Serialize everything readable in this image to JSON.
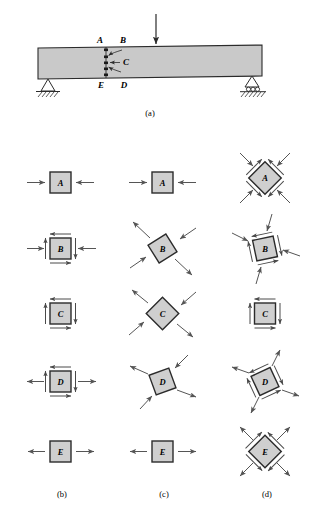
{
  "figure": {
    "colors": {
      "beam_fill": "#c9c9c9",
      "element_fill": "#cfcfcf",
      "outline": "#2b2b2b",
      "arrow": "#555555",
      "hatch": "#333333",
      "background": "#ffffff"
    }
  },
  "panel_a": {
    "caption": "(a)",
    "load_label": "",
    "points": [
      {
        "id": "A",
        "label": "A",
        "position": "top fiber"
      },
      {
        "id": "B",
        "label": "B",
        "position": "upper web"
      },
      {
        "id": "C",
        "label": "C",
        "position": "neutral axis"
      },
      {
        "id": "D",
        "label": "D",
        "position": "lower web"
      },
      {
        "id": "E",
        "label": "E",
        "position": "bottom fiber"
      }
    ],
    "supports": {
      "left": "pin-support",
      "right": "roller-support"
    }
  },
  "columns": [
    {
      "id": "b",
      "caption": "(b)",
      "description": "original x-y stress elements"
    },
    {
      "id": "c",
      "caption": "(c)",
      "description": "principal stress elements"
    },
    {
      "id": "d",
      "caption": "(d)",
      "description": "maximum shear stress elements"
    }
  ],
  "elements": {
    "b": [
      {
        "label": "A",
        "rotation": 0,
        "normals": "compression",
        "shear": false
      },
      {
        "label": "B",
        "rotation": 0,
        "normals": "compression",
        "shear": true
      },
      {
        "label": "C",
        "rotation": 0,
        "normals": "none",
        "shear": true
      },
      {
        "label": "D",
        "rotation": 0,
        "normals": "tension",
        "shear": true
      },
      {
        "label": "E",
        "rotation": 0,
        "normals": "tension",
        "shear": false
      }
    ],
    "c": [
      {
        "label": "A",
        "rotation": 0,
        "normals": "compression",
        "shear": false
      },
      {
        "label": "B",
        "rotation": 30,
        "normals": "biaxial",
        "shear": false
      },
      {
        "label": "C",
        "rotation": 45,
        "normals": "biaxial",
        "shear": false
      },
      {
        "label": "D",
        "rotation": 20,
        "normals": "biaxial",
        "shear": false
      },
      {
        "label": "E",
        "rotation": 0,
        "normals": "tension",
        "shear": false
      }
    ],
    "d": [
      {
        "label": "A",
        "rotation": 45,
        "normals": "compression",
        "shear": true
      },
      {
        "label": "B",
        "rotation": 12,
        "normals": "compression",
        "shear": true
      },
      {
        "label": "C",
        "rotation": 0,
        "normals": "none",
        "shear": true
      },
      {
        "label": "D",
        "rotation": 25,
        "normals": "tension",
        "shear": true
      },
      {
        "label": "E",
        "rotation": 45,
        "normals": "tension",
        "shear": true
      }
    ]
  },
  "row_labels": [
    "A",
    "B",
    "C",
    "D",
    "E"
  ],
  "captions": {
    "a": "(a)",
    "b": "(b)",
    "c": "(c)",
    "d": "(d)"
  }
}
